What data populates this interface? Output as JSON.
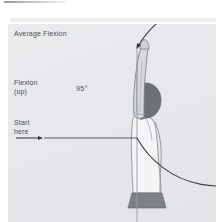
{
  "figure": {
    "title": "Average Flexion",
    "labels": {
      "average_flexion": "Average Flexion",
      "flexion_up": "Flexion\n(up)",
      "start_here": "Start\nhere",
      "angle": "95°"
    },
    "angle_degrees": 95,
    "colors": {
      "panel_background": "#e9eaec",
      "page_background": "#ffffff",
      "text": "#4c4f52",
      "arc_line": "#3f4245",
      "baseline": "#4a4d50",
      "body_outline": "#8d9094",
      "head_fill": "#6e7174",
      "waistband_fill": "#7e8184",
      "arm_fill": "#d6d8da",
      "vertical_axis": "#9a9da0"
    },
    "elements": {
      "arc": "flexion-arc",
      "arrowhead_top": "arc-end-arrowhead",
      "arrowhead_start": "start-here-arrowhead",
      "baseline": "horizontal-start-line",
      "vertical_axis": "vertical-reference-line",
      "body": "person-side-view"
    }
  }
}
